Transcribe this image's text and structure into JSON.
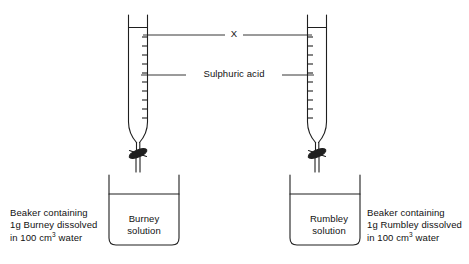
{
  "diagram": {
    "background_color": "#ffffff",
    "line_color": "#1f1f1f",
    "labels": {
      "x_marker": "X",
      "reagent": "Sulphuric acid"
    },
    "left_apparatus": {
      "burette_name": "left-burette",
      "beaker_label": "Burney\nsolution",
      "caption": "Beaker containing\n1g Burney dissolved\nin 100 cm",
      "caption_superscript": "3",
      "caption_tail": " water"
    },
    "right_apparatus": {
      "burette_name": "right-burette",
      "beaker_label": "Rumbley\nsolution",
      "caption": "Beaker containing\n1g Rumbley dissolved\nin 100 cm",
      "caption_superscript": "3",
      "caption_tail": " water"
    }
  }
}
